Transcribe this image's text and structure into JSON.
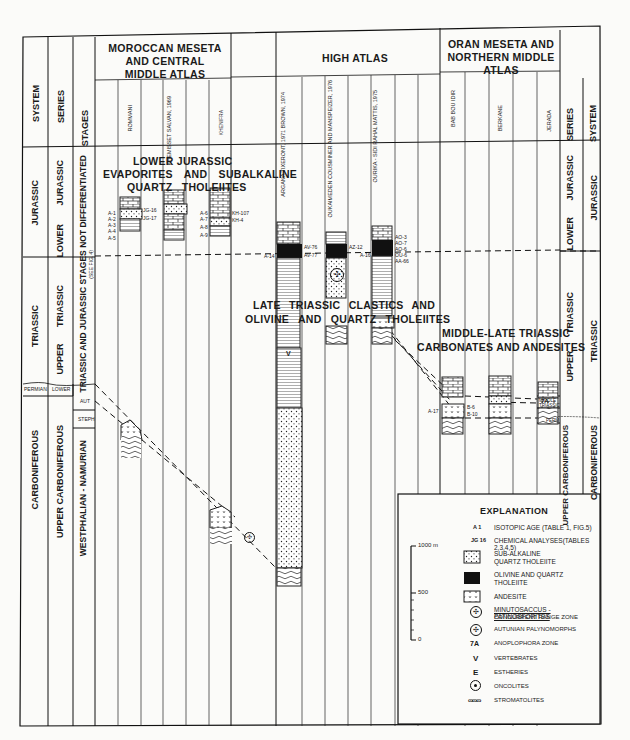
{
  "columns_left": {
    "system_header": "SYSTEM",
    "series_header": "SERIES",
    "stages_header": "STAGES",
    "system": [
      "JURASSIC",
      "TRIASSIC",
      "PERMIAN",
      "CARBONIFEROUS"
    ],
    "series": [
      "LOWER JURASSIC",
      "UPPER TRIASSIC",
      "LOWER",
      "UPPER CARBONIFEROUS"
    ],
    "stages": [
      "TRIASSIC AND JURASSIC STAGES NOT DIFFERENTIATED",
      "(SEE FIG. 4)",
      "AUT",
      "STEPH",
      "WESTPHALIAN - NAMURIAN"
    ]
  },
  "columns_right": {
    "series_header": "SERIES",
    "system_header": "SYSTEM",
    "series": [
      "LOWER JURASSIC",
      "UPPER TRIASSIC",
      "MIDDLE TRIASSIC",
      "PERM",
      "UPPER CARBONIFEROUS"
    ],
    "system": [
      "JURASSIC",
      "TRIASSIC",
      "CARBONIFEROUS"
    ]
  },
  "regions": [
    {
      "title": "MOROCCAN MESETA AND CENTRAL MIDDLE ATLAS",
      "sections": [
        "ROMMANI",
        "KHEMISSET SALVAN, 1969",
        "KHENIFRA"
      ]
    },
    {
      "title": "HIGH ATLAS",
      "sections": [
        "ARGANA TIXERONT, 1971 BROWN, 1974",
        "OUKAIMEDEN COUSMINER AND MANSPEIZER, 1976",
        "OURIKA - SIDI RAHAL MATTIS, 1975"
      ]
    },
    {
      "title": "ORAN MESETA AND NORTHERN MIDDLE ATLAS",
      "sections": [
        "BAB BOU IDIR",
        "BERKANE",
        "JERADA"
      ]
    }
  ],
  "annotations": {
    "lower_jurassic": [
      "LOWER JURASSIC",
      "EVAPORITES AND SUBALKALINE",
      "QUARTZ THOLEIITES"
    ],
    "late_triassic": [
      "LATE TRIASSIC CLASTICS AND",
      "OLIVINE AND QUARTZ THOLEIITES"
    ],
    "middle_late_triassic": [
      "MIDDLE-LATE TRIASSIC",
      "CARBONATES AND ANDESITES"
    ]
  },
  "sample_labels": {
    "rommani_left": [
      "A-1",
      "A-2",
      "A-3",
      "A-4",
      "A-5"
    ],
    "rommani_right": [
      "JG-16",
      "JG-17"
    ],
    "khenifra_left": [
      "A-6",
      "A-7",
      "A-8",
      "A-9"
    ],
    "khenifra_right": [
      "KH-107",
      "KH-4"
    ],
    "argana_left": "A-14",
    "argana_right": [
      "AV-76",
      "AV-77"
    ],
    "oukaimeden_right": "AZ-12",
    "ourika_left": "A-16",
    "ourika_right": [
      "AO-3",
      "AO-7",
      "AO-6",
      "OU-6",
      "AA-66"
    ],
    "bab_left": "A-17",
    "bab_right": [
      "B-6",
      "B-10"
    ]
  },
  "legend": {
    "title": "EXPLANATION",
    "items": [
      {
        "symbol": "A 1",
        "label": "ISOTOPIC AGE (TABLE 1, FIG.5)"
      },
      {
        "symbol": "JG 16",
        "label": "CHEMICAL ANALYSES(TABLES 2,3,4,5)"
      },
      {
        "symbol": "dots-box",
        "label": "SUB-ALKALINE QUARTZ THOLEIITE"
      },
      {
        "symbol": "black-box",
        "label": "OLIVINE AND QUARTZ THOLEIITE"
      },
      {
        "symbol": "v-box",
        "label": "ANDESITE"
      },
      {
        "symbol": "pollen-icon",
        "label": "MINUTOSACCUS - PATINOSFORITES",
        "label2": "CONCURRENT RANGE ZONE"
      },
      {
        "symbol": "pollen-icon-2",
        "label": "AUTUNIAN PALYNOMORPHS"
      },
      {
        "symbol": "7A",
        "label": "ANOPLOPHORA ZONE"
      },
      {
        "symbol": "V",
        "label": "VERTEBRATES"
      },
      {
        "symbol": "E",
        "label": "ESTHERIES"
      },
      {
        "symbol": "oncolite-icon",
        "label": "ONCOLITES"
      },
      {
        "symbol": "stromatolite-icon",
        "label": "STROMATOLITES"
      }
    ]
  },
  "scale": {
    "top": "1000 m",
    "mid": "500",
    "bottom": "0"
  }
}
